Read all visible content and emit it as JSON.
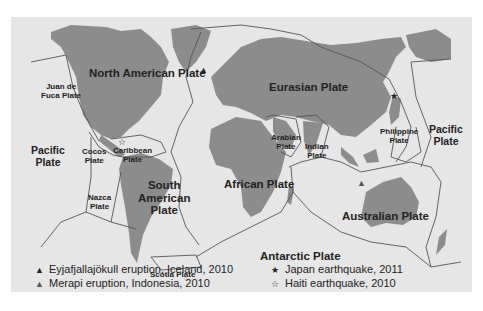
{
  "map": {
    "type": "tectonic-plates-world-map",
    "colors": {
      "ocean": "#e6e6e6",
      "land": "#8c8c8c",
      "boundary": "#555555",
      "text": "#222222",
      "page": "#ffffff"
    },
    "plates": {
      "north_american": "North American Plate",
      "juan_de_fuca": "Juan de Fuca Plate",
      "juan_de_fuca_l1": "Juan de",
      "juan_de_fuca_l2": "Fuca Plate",
      "pacific_west_l1": "Pacific",
      "pacific_west_l2": "Plate",
      "cocos_l1": "Cocos",
      "cocos_l2": "Plate",
      "caribbean_l1": "Caribbean",
      "caribbean_l2": "Plate",
      "nazca_l1": "Nazca",
      "nazca_l2": "Plate",
      "south_american_l1": "South",
      "south_american_l2": "American",
      "south_american_l3": "Plate",
      "scotia": "Scotia Plate",
      "eurasian": "Eurasian Plate",
      "arabian_l1": "Arabian",
      "arabian_l2": "Plate",
      "indian_l1": "Indian",
      "indian_l2": "Plate",
      "african": "African Plate",
      "philippine_l1": "Philippine",
      "philippine_l2": "Plate",
      "pacific_east_l1": "Pacific",
      "pacific_east_l2": "Plate",
      "australian": "Australian Plate",
      "antarctic": "Antarctic Plate"
    },
    "markers": {
      "eyjafjallajokull": {
        "icon": "volcano-filled-icon",
        "glyph": "▲"
      },
      "merapi": {
        "icon": "volcano-outline-icon",
        "glyph": "▲"
      },
      "japan": {
        "icon": "star-filled-icon",
        "glyph": "★"
      },
      "haiti": {
        "icon": "star-outline-icon",
        "glyph": "☆"
      }
    },
    "legend": [
      {
        "icon": "volcano-filled-icon",
        "glyph": "▲",
        "label": "Eyjafjallajökull eruption, Iceland, 2010"
      },
      {
        "icon": "volcano-outline-icon",
        "glyph": "▲",
        "label": "Merapi eruption, Indonesia, 2010"
      },
      {
        "icon": "star-filled-icon",
        "glyph": "★",
        "label": "Japan earthquake, 2011"
      },
      {
        "icon": "star-outline-icon",
        "glyph": "☆",
        "label": "Haiti earthquake, 2010"
      }
    ]
  }
}
